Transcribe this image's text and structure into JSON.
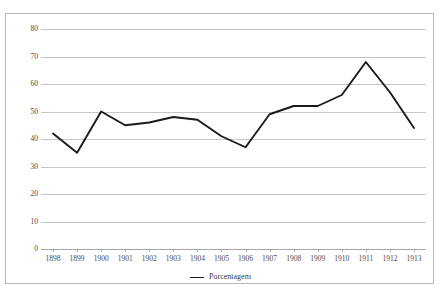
{
  "chart_title": "",
  "legend": {
    "position": "bottom",
    "entries": [
      {
        "label": "Porcentagem",
        "color": "#1a1a1a",
        "marker": "line-swatch"
      }
    ]
  },
  "axes": {
    "y_ticks": [
      80,
      70,
      60,
      50,
      40,
      30,
      20,
      10,
      0
    ],
    "x_ticks": [
      "1898",
      "1899",
      "1900",
      "1901",
      "1902",
      "1903",
      "1904",
      "1905",
      "1906",
      "1907",
      "1908",
      "1909",
      "1910",
      "1911",
      "1912",
      "1913"
    ]
  },
  "chart_data": {
    "type": "line",
    "title": "",
    "xlabel": "",
    "ylabel": "",
    "ylim": [
      0,
      80
    ],
    "ytick_step": 10,
    "grid": true,
    "legend_position": "bottom",
    "categories": [
      "1898",
      "1899",
      "1900",
      "1901",
      "1902",
      "1903",
      "1904",
      "1905",
      "1906",
      "1907",
      "1908",
      "1909",
      "1910",
      "1911",
      "1912",
      "1913"
    ],
    "series": [
      {
        "name": "Porcentagem",
        "color": "#1a1a1a",
        "values": [
          42,
          35,
          50,
          45,
          46,
          48,
          47,
          41,
          37,
          49,
          52,
          52,
          56,
          68,
          57,
          44
        ]
      }
    ]
  }
}
